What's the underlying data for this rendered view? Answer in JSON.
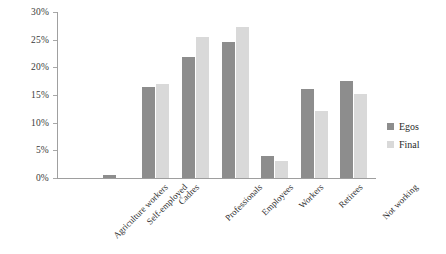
{
  "chart_data": {
    "type": "bar",
    "title": "",
    "xlabel": "",
    "ylabel": "",
    "ylim": [
      0,
      30
    ],
    "ytick_values": [
      0,
      5,
      10,
      15,
      20,
      25,
      30
    ],
    "ytick_labels": [
      "0%",
      "5%",
      "10%",
      "15%",
      "20%",
      "25%",
      "30%"
    ],
    "grid": false,
    "legend_position": "right",
    "categories": [
      "Agriculture workers",
      "Self-employed",
      "Cadres",
      "Professionals",
      "Employees",
      "Workers",
      "Retirees",
      "Not working"
    ],
    "series": [
      {
        "name": "Egos",
        "color": "#8d8d8d",
        "values": [
          0.0,
          0.5,
          16.4,
          21.8,
          24.6,
          4.0,
          16.0,
          17.6
        ]
      },
      {
        "name": "Final",
        "color": "#d9d9d9",
        "values": [
          0.0,
          0.0,
          17.0,
          25.5,
          27.3,
          3.0,
          12.2,
          15.2
        ]
      }
    ]
  }
}
